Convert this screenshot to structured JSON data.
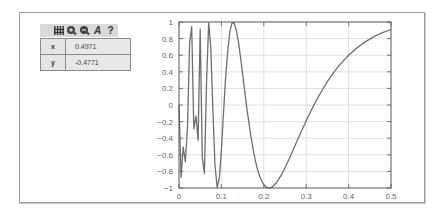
{
  "toolbar": {
    "icons": [
      "grid-icon",
      "zoom-in-icon",
      "zoom-out-icon",
      "annotate-icon",
      "help-icon"
    ],
    "help_glyph": "?",
    "annotate_glyph": "A"
  },
  "readout": {
    "rows": [
      {
        "label": "x",
        "value": "0.4971"
      },
      {
        "label": "y",
        "value": "-0.4771"
      }
    ]
  },
  "colors": {
    "line": "#6e6e6e",
    "grid": "#d8d8d8",
    "axis": "#555555",
    "toolbar_bg": "#d9d9d9",
    "table_bg": "#e4e4e4"
  },
  "chart_data": {
    "type": "line",
    "title": "",
    "xlabel": "",
    "ylabel": "",
    "xlim": [
      0,
      0.5
    ],
    "ylim": [
      -1,
      1
    ],
    "grid": true,
    "legend": null,
    "x_ticks": [
      "0",
      "0.1",
      "0.2",
      "0.3",
      "0.4",
      "0.5"
    ],
    "y_ticks": [
      "1",
      "0.8",
      "0.6",
      "0.4",
      "0.2",
      "0",
      "-0.2",
      "-0.4",
      "-0.6",
      "-0.8",
      "-1"
    ],
    "series": [
      {
        "name": "sin(1/x)",
        "x": [
          0.005,
          0.01,
          0.015,
          0.02,
          0.025,
          0.03,
          0.035,
          0.04,
          0.045,
          0.05,
          0.055,
          0.06,
          0.065,
          0.07,
          0.075,
          0.08,
          0.085,
          0.09,
          0.095,
          0.1,
          0.105,
          0.11,
          0.115,
          0.12,
          0.125,
          0.13,
          0.135,
          0.14,
          0.145,
          0.15,
          0.155,
          0.16,
          0.165,
          0.17,
          0.175,
          0.18,
          0.185,
          0.19,
          0.195,
          0.2,
          0.205,
          0.21,
          0.215,
          0.22,
          0.225,
          0.23,
          0.235,
          0.24,
          0.245,
          0.25,
          0.26,
          0.27,
          0.28,
          0.29,
          0.3,
          0.31,
          0.32,
          0.33,
          0.34,
          0.35,
          0.36,
          0.37,
          0.38,
          0.39,
          0.4,
          0.42,
          0.44,
          0.46,
          0.48,
          0.5
        ],
        "y": [
          -0.8733,
          -0.5064,
          -0.6846,
          -0.2624,
          0.7451,
          0.9437,
          -0.2863,
          -0.1324,
          -0.4271,
          0.9129,
          -0.638,
          -0.8256,
          0.2942,
          0.9902,
          0.6877,
          -0.0663,
          -0.726,
          -0.9944,
          -0.8819,
          -0.544,
          -0.0948,
          0.3265,
          0.6621,
          0.8863,
          0.9894,
          0.9882,
          0.909,
          0.763,
          0.5782,
          0.3742,
          0.168,
          -0.0332,
          -0.2208,
          -0.3893,
          -0.5391,
          -0.6659,
          -0.7712,
          -0.8539,
          -0.916,
          -0.9589,
          -0.9856,
          -0.999,
          -0.9981,
          -0.9858,
          -0.9641,
          -0.9336,
          -0.8962,
          -0.8541,
          -0.8078,
          -0.7568,
          -0.6485,
          -0.5306,
          -0.4144,
          -0.303,
          -0.1906,
          -0.0841,
          0.0166,
          0.1109,
          0.1987,
          0.2806,
          0.356,
          0.4257,
          0.4892,
          0.5466,
          0.5985,
          0.6887,
          0.7639,
          0.8237,
          0.872,
          0.9093
        ]
      }
    ]
  }
}
